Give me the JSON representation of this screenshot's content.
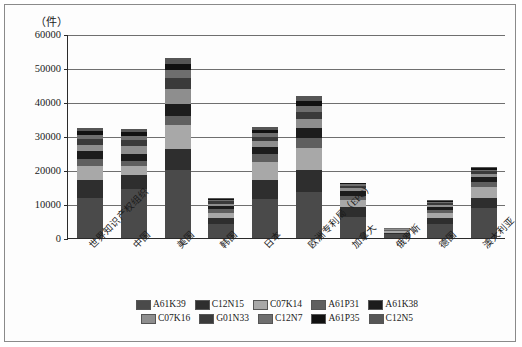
{
  "chart_data": {
    "type": "bar",
    "subtype": "stacked",
    "title": "",
    "xlabel": "",
    "ylabel": "（件）",
    "ylim": [
      0,
      60000
    ],
    "ytick_labels": [
      "60000",
      "50000",
      "40000",
      "30000",
      "20000",
      "10000",
      "0"
    ],
    "ytick_values": [
      60000,
      50000,
      40000,
      30000,
      20000,
      10000,
      0
    ],
    "grid": true,
    "legend_position": "bottom",
    "categories": [
      "世界知识产权组织",
      "中国",
      "美国",
      "韩国",
      "日本",
      "欧洲专利局（EPO）",
      "加拿大",
      "俄罗斯",
      "德国",
      "澳大利亚"
    ],
    "series": [
      {
        "name": "A61K39",
        "color": "#4a4a4a",
        "values": [
          11800,
          14300,
          20000,
          4200,
          11600,
          13600,
          6200,
          1100,
          4000,
          8700
        ]
      },
      {
        "name": "C12N15",
        "color": "#2e2e2e",
        "values": [
          5400,
          4200,
          6300,
          1800,
          5500,
          6400,
          3000,
          500,
          1900,
          3200
        ]
      },
      {
        "name": "C07K14",
        "color": "#a8a8a8",
        "values": [
          3900,
          2600,
          6800,
          1500,
          5200,
          6500,
          2100,
          400,
          1400,
          3000
        ]
      },
      {
        "name": "A61P31",
        "color": "#5f5f5f",
        "values": [
          2000,
          1500,
          2800,
          900,
          2300,
          2900,
          1200,
          250,
          900,
          1600
        ]
      },
      {
        "name": "A61K38",
        "color": "#1c1c1c",
        "values": [
          2400,
          2100,
          3600,
          900,
          2300,
          3000,
          1400,
          200,
          900,
          1500
        ]
      },
      {
        "name": "C07K16",
        "color": "#8e8e8e",
        "values": [
          1900,
          2500,
          4400,
          800,
          1700,
          2700,
          900,
          150,
          700,
          900
        ]
      },
      {
        "name": "G01N33",
        "color": "#3a3a3a",
        "values": [
          1700,
          1600,
          3100,
          700,
          1200,
          1900,
          600,
          120,
          500,
          700
        ]
      },
      {
        "name": "C12N7",
        "color": "#6e6e6e",
        "values": [
          1300,
          1200,
          2300,
          500,
          1100,
          1800,
          400,
          100,
          350,
          500
        ]
      },
      {
        "name": "A61P35",
        "color": "#111111",
        "values": [
          1100,
          1100,
          2000,
          300,
          900,
          1600,
          300,
          100,
          250,
          400
        ]
      },
      {
        "name": "C12N5",
        "color": "#565656",
        "values": [
          1000,
          900,
          1700,
          200,
          800,
          1400,
          200,
          80,
          200,
          300
        ]
      }
    ],
    "totals": [
      32500,
      32000,
      53000,
      11800,
      32600,
      41800,
      16300,
      3000,
      11100,
      20800
    ]
  }
}
